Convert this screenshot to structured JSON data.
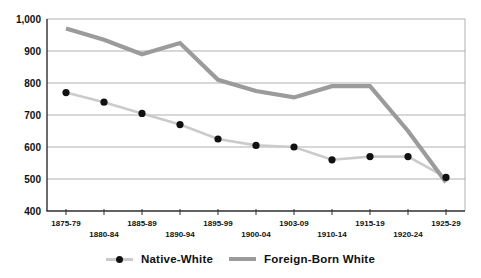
{
  "chart_data": {
    "type": "line",
    "title": "",
    "categories": [
      "1875-79",
      "1880-84",
      "1885-89",
      "1890-94",
      "1895-99",
      "1900-04",
      "1903-09",
      "1910-14",
      "1915-19",
      "1920-24",
      "1925-29"
    ],
    "series": [
      {
        "name": "Native-White",
        "values": [
          770,
          740,
          705,
          670,
          625,
          605,
          600,
          560,
          570,
          570,
          505
        ],
        "line_color": "#cbcbcb",
        "line_width": 2.6,
        "marker": "circle",
        "marker_color": "#111111",
        "marker_radius": 3.6
      },
      {
        "name": "Foreign-Born White",
        "values": [
          970,
          935,
          890,
          925,
          810,
          775,
          755,
          790,
          790,
          650,
          490
        ],
        "line_color": "#9b9b9b",
        "line_width": 4.2,
        "marker": "none"
      }
    ],
    "xlabel": "",
    "ylabel": "",
    "ylim": [
      400,
      1000
    ],
    "ytick_values": [
      400,
      500,
      600,
      700,
      800,
      900,
      1000
    ],
    "ytick_labels": [
      "400",
      "500",
      "600",
      "700",
      "800",
      "900",
      "1,000"
    ],
    "grid": true,
    "gridline_color": "#b0b0b0",
    "axis_color": "#2e2e2e",
    "label_color": "#0f0f0f",
    "background_color": "#ffffff",
    "legend_position": "bottom",
    "x_labels_staggered": true
  },
  "legend": {
    "items": [
      {
        "label": "Native-White",
        "marker": "dot-on-light-line"
      },
      {
        "label": "Foreign-Born White",
        "marker": "thick-gray-line"
      }
    ]
  }
}
